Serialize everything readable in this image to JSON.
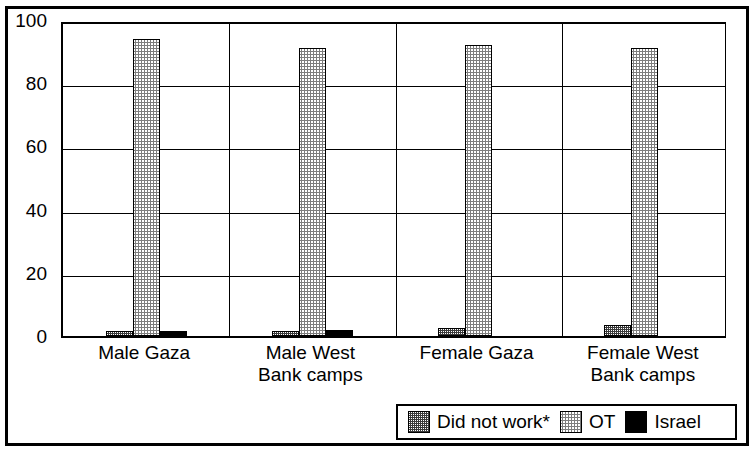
{
  "chart_data": {
    "type": "bar",
    "title": "",
    "subtitle": "",
    "xlabel": "",
    "ylabel": "",
    "ylim": [
      0,
      100
    ],
    "yticks": [
      0,
      20,
      40,
      60,
      80,
      100
    ],
    "grid": true,
    "legend_position": "bottom-right",
    "categories": [
      "Male Gaza",
      "Male West Bank camps",
      "Female Gaza",
      "Female West Bank camps"
    ],
    "category_lines": [
      [
        "Male Gaza"
      ],
      [
        "Male West",
        "Bank camps"
      ],
      [
        "Female Gaza"
      ],
      [
        "Female West",
        "Bank camps"
      ]
    ],
    "series": [
      {
        "name": "Did not work*",
        "values": [
          1.5,
          1.5,
          2.5,
          3.5
        ],
        "fill": "checker-50",
        "color": "#3a3a3a"
      },
      {
        "name": "OT",
        "values": [
          94,
          91,
          92,
          91
        ],
        "fill": "checker-light",
        "color": "#7d7d7d"
      },
      {
        "name": "Israel",
        "values": [
          1.5,
          2,
          0,
          0
        ],
        "fill": "solid",
        "color": "#000000"
      }
    ]
  },
  "legend": {
    "items": [
      {
        "label": "Did not work*",
        "swatch": "checker-50"
      },
      {
        "label": "OT",
        "swatch": "checker-light"
      },
      {
        "label": "Israel",
        "swatch": "solid-black"
      }
    ]
  },
  "axis": {
    "y_tick_labels": [
      "100",
      "80",
      "60",
      "40",
      "20",
      "0"
    ]
  }
}
